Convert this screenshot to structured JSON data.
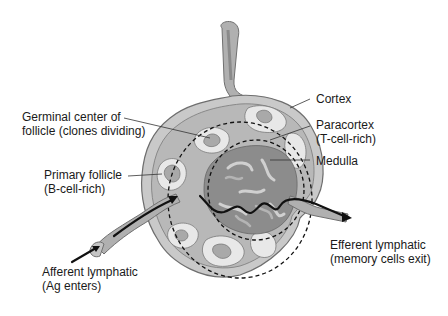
{
  "diagram": {
    "labels": {
      "germinal_center": [
        "Germinal center of",
        "follicle (clones dividing)"
      ],
      "primary_follicle": [
        "Primary follicle",
        "(B-cell-rich)"
      ],
      "afferent": [
        "Afferent lymphatic",
        "(Ag enters)"
      ],
      "cortex": [
        "Cortex"
      ],
      "paracortex": [
        "Paracortex",
        "(T-cell-rich)"
      ],
      "medulla": [
        "Medulla"
      ],
      "efferent": [
        "Efferent lymphatic",
        "(memory cells exit)"
      ]
    },
    "colors": {
      "capsule_outer": "#c9c9c9",
      "capsule_line": "#7a7a7a",
      "cortex_fill": "#b8b8b8",
      "follicle_light": "#e8e8e8",
      "follicle_mid": "#a9a9a9",
      "medulla_dark": "#8c8c8c",
      "arrow": "#111111"
    }
  }
}
